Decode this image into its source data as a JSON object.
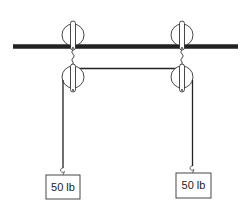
{
  "diagram": {
    "type": "pulley-system",
    "colors": {
      "line": "#222222",
      "background": "#ffffff"
    },
    "ceiling_bar": {
      "x1": 13,
      "x2": 238,
      "y": 46.5,
      "thickness": 4
    },
    "pulleys": [
      {
        "id": "top-left",
        "cx": 73,
        "cy": 35,
        "r": 11
      },
      {
        "id": "top-right",
        "cx": 182,
        "cy": 35,
        "r": 11
      },
      {
        "id": "bottom-left",
        "cx": 73,
        "cy": 77,
        "r": 11
      },
      {
        "id": "bottom-right",
        "cx": 182,
        "cy": 77,
        "r": 11
      }
    ],
    "weights": [
      {
        "id": "left-weight",
        "label": "50 lb",
        "x": 46,
        "y": 175,
        "w": 34,
        "h": 24,
        "rope_x": 63
      },
      {
        "id": "right-weight",
        "label": "50 lb",
        "x": 176,
        "y": 173,
        "w": 35,
        "h": 25,
        "rope_x": 193
      }
    ]
  }
}
